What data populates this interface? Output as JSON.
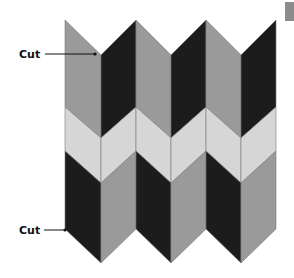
{
  "labels": {
    "top_cut": "Cut",
    "bottom_cut": "Cut"
  },
  "colors": {
    "dark": "#1c1c1c",
    "mid": "#9a9a9a",
    "light": "#d6d6d6",
    "edge": "#7a7a7a",
    "label": "#111111",
    "corner_tab": "#8c8c8c"
  },
  "geometry": {
    "column_x": [
      65,
      101,
      136,
      171,
      206,
      241,
      276
    ],
    "top_edge": {
      "peak_y": 20,
      "valley_y": 55
    },
    "light_top": {
      "peak_y": 107,
      "valley_y": 138
    },
    "light_bottom": {
      "peak_y": 151,
      "valley_y": 183
    },
    "bottom_edge": {
      "peak_y": 229,
      "valley_y": 263
    }
  },
  "bands": {
    "top": [
      "mid",
      "dark",
      "mid",
      "dark",
      "mid",
      "dark"
    ],
    "middle": [
      "light",
      "light",
      "light",
      "light",
      "light",
      "light"
    ],
    "bottom": [
      "dark",
      "mid",
      "dark",
      "mid",
      "dark",
      "mid"
    ]
  }
}
